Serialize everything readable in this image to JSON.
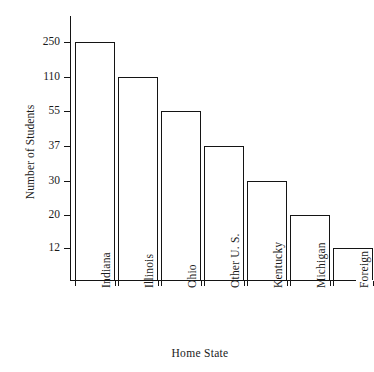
{
  "chart_data": {
    "type": "bar",
    "title": "",
    "xlabel": "Home State",
    "ylabel": "Number of Students",
    "categories": [
      "Indiana",
      "Illinois",
      "Ohio",
      "Other U. S.",
      "Kentucky",
      "Michigan",
      "Foreign"
    ],
    "values": [
      250,
      110,
      55,
      37,
      30,
      20,
      12
    ],
    "ytick_labels": [
      "250",
      "110",
      "55",
      "37",
      "30",
      "20",
      "12"
    ],
    "ytick_values": [
      250,
      110,
      55,
      37,
      30,
      20,
      12
    ],
    "y_scale_note": "non-linear: tick spacing is uniform, each tick equals one bar top",
    "grid": false,
    "legend": false,
    "bar_fill": "#ffffff",
    "bar_edge": "#141414",
    "background": "#ffffff"
  },
  "axes": {
    "y_title": "Number of Students",
    "x_title": "Home State"
  },
  "ticks": [
    {
      "label": "250",
      "top": 42
    },
    {
      "label": "110",
      "top": 77
    },
    {
      "label": "55",
      "top": 111
    },
    {
      "label": "37",
      "top": 146
    },
    {
      "label": "30",
      "top": 181
    },
    {
      "label": "20",
      "top": 215
    },
    {
      "label": "12",
      "top": 248
    }
  ],
  "bars": [
    {
      "category": "Indiana",
      "value": 250,
      "left": 75,
      "width": 40,
      "top": 42
    },
    {
      "category": "Illinois",
      "value": 110,
      "left": 118,
      "width": 40,
      "top": 77
    },
    {
      "category": "Ohio",
      "value": 55,
      "left": 161,
      "width": 40,
      "top": 111
    },
    {
      "category": "Other U. S.",
      "value": 37,
      "left": 204,
      "width": 40,
      "top": 146
    },
    {
      "category": "Kentucky",
      "value": 30,
      "left": 247,
      "width": 40,
      "top": 181
    },
    {
      "category": "Michigan",
      "value": 20,
      "left": 290,
      "width": 40,
      "top": 215
    },
    {
      "category": "Foreign",
      "value": 12,
      "left": 333,
      "width": 40,
      "top": 248
    }
  ]
}
